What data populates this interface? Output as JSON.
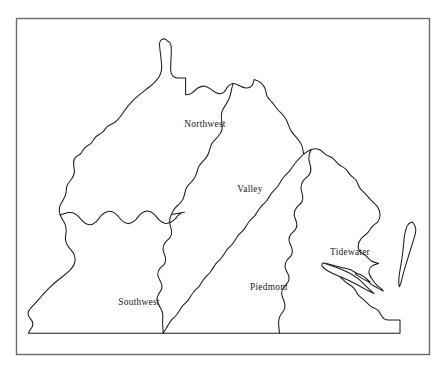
{
  "figure": {
    "kind": "region-map",
    "background_color": "#ffffff",
    "frame": {
      "name": "map-frame",
      "color": "#6b6b70",
      "x": 16,
      "y": 18,
      "width": 414,
      "height": 337
    },
    "line_color": "#1c1c1c",
    "line_width": 1.05
  },
  "regions": [
    {
      "id": "northwest",
      "label": "Northwest",
      "label_x": 205,
      "label_y": 127,
      "label_color": "#1b1b1b"
    },
    {
      "id": "valley",
      "label": "Valley",
      "label_x": 250,
      "label_y": 192,
      "label_color": "#1b1b1b"
    },
    {
      "id": "southwest",
      "label": "Southwest",
      "label_x": 139,
      "label_y": 305,
      "label_color": "#1b1b1b"
    },
    {
      "id": "piedmont",
      "label": "Piedmont",
      "label_x": 269,
      "label_y": 290,
      "label_color": "#1b1b1b"
    },
    {
      "id": "tidewater",
      "label": "Tidewater",
      "label_x": 350,
      "label_y": 255,
      "label_color": "#1b1b1b"
    }
  ],
  "features": [
    {
      "id": "mainland",
      "name": "mainland-outline",
      "description": "Combined outline of West Virginia and Virginia"
    },
    {
      "id": "eastern-shore",
      "name": "eastern-shore-peninsula",
      "description": "Detached narrow peninsula east of the bay"
    },
    {
      "id": "bay-inlet",
      "name": "james-river-inlet",
      "description": "Narrow water wedge cutting inland from the coast"
    }
  ]
}
